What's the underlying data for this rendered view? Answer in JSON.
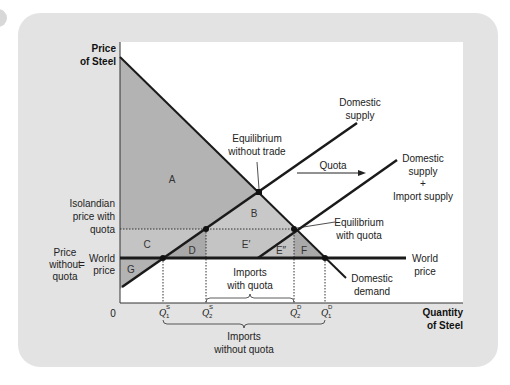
{
  "figure": {
    "y_axis_label": [
      "Price",
      "of Steel"
    ],
    "x_axis_label": [
      "Quantity",
      "of Steel"
    ],
    "origin_label": "0",
    "price_labels": {
      "quota_price": [
        "Isolandian",
        "price with",
        "quota"
      ],
      "price_without_quota": [
        "Price",
        "without",
        "quota"
      ],
      "equals": "=",
      "world_price_left": [
        "World",
        "price"
      ]
    },
    "curve_labels": {
      "domestic_supply": [
        "Domestic",
        "supply"
      ],
      "domestic_plus_import_supply": [
        "Domestic",
        "supply",
        "+",
        "Import supply"
      ],
      "domestic_demand": [
        "Domestic",
        "demand"
      ],
      "world_price_right": [
        "World",
        "price"
      ]
    },
    "annotations": {
      "equilibrium_without_trade": [
        "Equilibrium",
        "without trade"
      ],
      "equilibrium_with_quota": [
        "Equilibrium",
        "with quota"
      ],
      "quota_arrow": "Quota",
      "imports_with_quota": [
        "Imports",
        "with quota"
      ],
      "imports_without_quota": [
        "Imports",
        "without quota"
      ]
    },
    "areas": [
      "A",
      "B",
      "C",
      "D",
      "E′",
      "E″",
      "F",
      "G"
    ],
    "quantity_ticks": [
      {
        "base": "Q",
        "sup": "S",
        "sub": "1"
      },
      {
        "base": "Q",
        "sup": "S",
        "sub": "2"
      },
      {
        "base": "Q",
        "sup": "D",
        "sub": "2"
      },
      {
        "base": "Q",
        "sup": "D",
        "sub": "1"
      }
    ],
    "colors": {
      "panel": "#e3e3e3",
      "plot": "#ffffff",
      "shade_dark": "#a9a9a9",
      "shade_light": "#c8c8c8",
      "line": "#1a1a1a"
    }
  }
}
